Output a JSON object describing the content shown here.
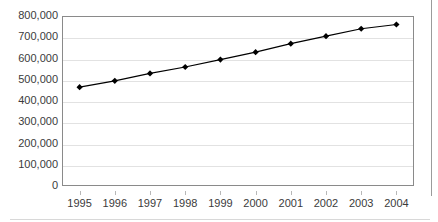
{
  "chart_data": {
    "type": "line",
    "title": "",
    "subtitle": "",
    "xlabel": "",
    "ylabel": "",
    "categories": [
      "1995",
      "1996",
      "1997",
      "1998",
      "1999",
      "2000",
      "2001",
      "2002",
      "2003",
      "2004"
    ],
    "values": [
      465000,
      495000,
      530000,
      560000,
      595000,
      630000,
      670000,
      705000,
      740000,
      760000
    ],
    "series": [
      {
        "name": "",
        "values": [
          465000,
          495000,
          530000,
          560000,
          595000,
          630000,
          670000,
          705000,
          740000,
          760000
        ]
      }
    ],
    "ylim": [
      0,
      800000
    ],
    "ytick_labels": [
      "0",
      "100,000",
      "200,000",
      "300,000",
      "400,000",
      "500,000",
      "600,000",
      "700,000",
      "800,000"
    ],
    "ytick_values": [
      0,
      100000,
      200000,
      300000,
      400000,
      500000,
      600000,
      700000,
      800000
    ],
    "xtick_labels": [
      "1995",
      "1996",
      "1997",
      "1998",
      "1999",
      "2000",
      "2001",
      "2002",
      "2003",
      "2004"
    ],
    "grid": "horizontal",
    "legend": "none",
    "marker": "diamond",
    "line_color": "#000000",
    "marker_color": "#000000",
    "grid_color": "#e2e2e2",
    "axis_color": "#8a8a8a",
    "text_color": "#3b3b3b",
    "background_color": "#ffffff",
    "annotations": []
  }
}
